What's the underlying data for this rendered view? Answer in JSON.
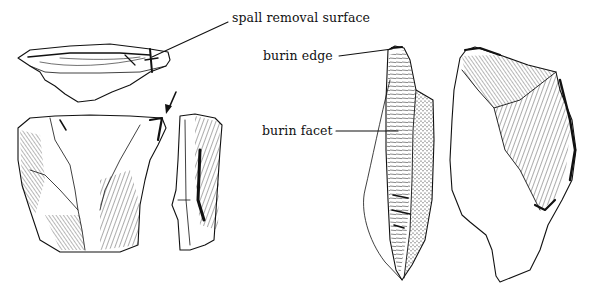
{
  "figure": {
    "labels": {
      "spall_removal_surface": "spall removal surface",
      "burin_edge": "burin edge",
      "burin_facet": "burin facet"
    },
    "annotations": [
      {
        "label": "spall removal surface",
        "points_to": "top of left spall fragment"
      },
      {
        "label": "burin edge",
        "points_to": "tip of center burin"
      },
      {
        "label": "burin facet",
        "points_to": "faceted face of center burin"
      }
    ],
    "arrow": "indicates direction of burin blow on left artifact",
    "colors": {
      "ink": "#111111",
      "paper": "#ffffff"
    }
  }
}
